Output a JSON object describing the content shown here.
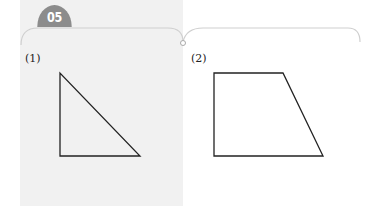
{
  "problem_number": "05",
  "subproblems": [
    {
      "label": "(1)",
      "shape": "right-triangle",
      "points": "60,73 60,156 140,156"
    },
    {
      "label": "(2)",
      "shape": "trapezoid",
      "points": "214,73 283,73 323,156 214,156"
    }
  ],
  "colors": {
    "badge": "#8c8c8c",
    "panel": "#f1f1f1",
    "line": "#222222",
    "frame": "#c8c8c8"
  }
}
